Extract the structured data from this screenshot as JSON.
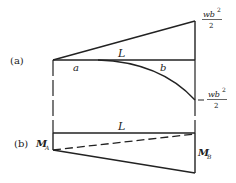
{
  "diagram": {
    "part_a": {
      "label": "(a)",
      "span_label": "L",
      "segment_a": "a",
      "segment_b": "b",
      "top_value": {
        "num": "wb",
        "exp": "2",
        "den": "2"
      },
      "bottom_value": {
        "sign": "−",
        "num": "wb",
        "exp": "2",
        "den": "2"
      }
    },
    "part_b": {
      "label": "(b)",
      "span_label": "L",
      "left_moment": {
        "base": "M",
        "sub": "A"
      },
      "right_moment": {
        "base": "M",
        "sub": "B"
      }
    }
  }
}
